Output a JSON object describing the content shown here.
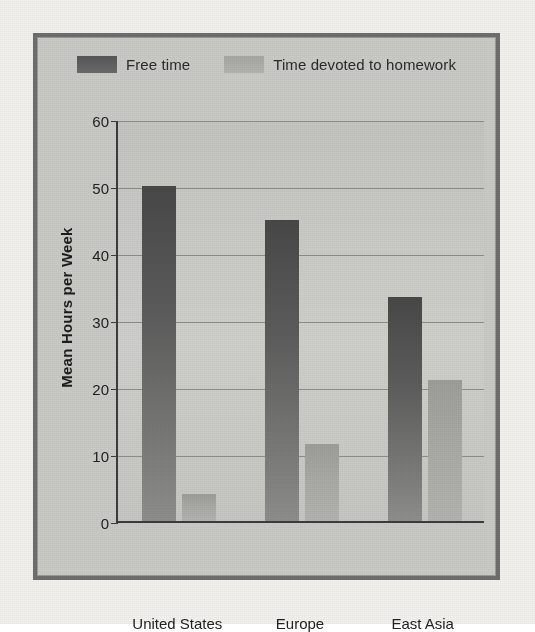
{
  "chart_data": {
    "type": "bar",
    "title": "",
    "xlabel": "",
    "ylabel": "Mean Hours per Week",
    "ylim": [
      0,
      60
    ],
    "yticks": [
      0,
      10,
      20,
      30,
      40,
      50,
      60
    ],
    "ytick_labels": [
      "0",
      "10",
      "20",
      "30",
      "40",
      "50",
      "60"
    ],
    "grid": true,
    "legend_position": "top-center",
    "categories": [
      "United States",
      "Europe",
      "East Asia"
    ],
    "series": [
      {
        "name": "Free time",
        "color": "#565656",
        "values": [
          50,
          45,
          33.5
        ]
      },
      {
        "name": "Time devoted to homework",
        "color": "#a6a6a3",
        "values": [
          4,
          11.5,
          21
        ]
      }
    ]
  },
  "legend": {
    "items": [
      {
        "label": "Free time",
        "swatch": "free-time-swatch"
      },
      {
        "label": "Time devoted to homework",
        "swatch": "homework-swatch"
      }
    ]
  },
  "axis": {
    "y_title": "Mean Hours per Week"
  },
  "colors": {
    "frame": "#6e6e6e",
    "plot_background": "#c9c9c5",
    "gridline": "#8d8d8a",
    "axis": "#3c3c3c",
    "free_time": "#565656",
    "homework": "#a6a6a3"
  }
}
